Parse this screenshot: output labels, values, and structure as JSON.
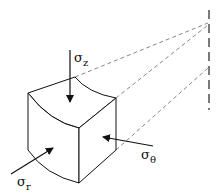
{
  "diagram": {
    "labels": {
      "sigma_z": {
        "symbol": "σ",
        "subscript": "z"
      },
      "sigma_theta": {
        "symbol": "σ",
        "subscript": "θ"
      },
      "sigma_r": {
        "symbol": "σ",
        "subscript": "r"
      }
    },
    "elements": [
      "curved stress element",
      "axial stress arrow",
      "hoop stress arrow",
      "radial stress arrow",
      "dashed projection lines",
      "dashed axis of symmetry"
    ],
    "colors": {
      "stroke": "#111111",
      "dashed": "#666666",
      "background": "#ffffff"
    }
  }
}
